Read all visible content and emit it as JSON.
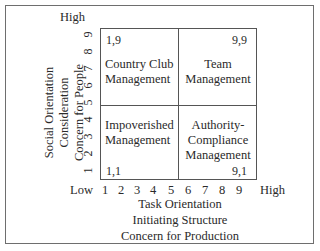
{
  "figure": {
    "y_axis": {
      "high_label": "High",
      "ticks": [
        "9",
        "8",
        "7",
        "6",
        "5",
        "4",
        "3",
        "2",
        "1"
      ],
      "title_lines": [
        "Social Orientation",
        "Consideration",
        "Concern for People"
      ]
    },
    "x_axis": {
      "low_label": "Low",
      "high_label": "High",
      "ticks": [
        "1",
        "2",
        "3",
        "4",
        "5",
        "6",
        "7",
        "8",
        "9"
      ],
      "title_lines": [
        "Task Orientation",
        "Initiating Structure",
        "Concern for Production"
      ]
    },
    "quadrants": {
      "top_left": {
        "coord": "1,9",
        "lines": [
          "Country Club",
          "Management"
        ]
      },
      "top_right": {
        "coord": "9,9",
        "lines": [
          "Team",
          "Management"
        ]
      },
      "bottom_left": {
        "coord": "1,1",
        "lines": [
          "Impoverished",
          "Management"
        ]
      },
      "bottom_right": {
        "coord": "9,1",
        "lines": [
          "Authority-",
          "Compliance",
          "Management"
        ]
      }
    }
  }
}
